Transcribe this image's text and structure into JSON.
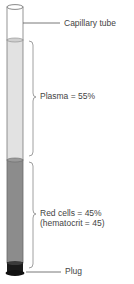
{
  "diagram": {
    "labels": {
      "capillary_tube": "Capillary tube",
      "plasma": "Plasma = 55%",
      "red_cells": "Red cells = 45%",
      "hematocrit": "(hematocrit = 45)",
      "plug": "Plug"
    },
    "colors": {
      "plasma": "#e2e2e2",
      "red_cells": "#8c8c8c",
      "plug": "#1a1a1a",
      "outline": "#7a7a7a"
    },
    "values": {
      "plasma_percent": 55,
      "red_cells_percent": 45,
      "hematocrit": 45
    }
  }
}
